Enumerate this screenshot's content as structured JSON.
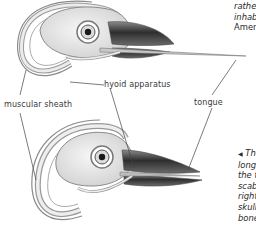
{
  "figure": {
    "labels": {
      "hyoid": "hyoid apparatus",
      "sheath": "muscular sheath",
      "tongue": "tongue"
    },
    "top_caption": {
      "lines": [
        "rather",
        "inhab",
        "Ameri"
      ]
    },
    "bottom_caption": {
      "arrow": "◀",
      "lines": [
        "The",
        "long",
        "the ti",
        "scabl",
        "right",
        "skull t",
        "bone"
      ]
    }
  },
  "colors": {
    "background": "#ffffff",
    "outline": "#6a6a6a",
    "bone": "#e6e6e6",
    "beak_dark": "#3b3b3b",
    "leader_line": "#444444"
  }
}
